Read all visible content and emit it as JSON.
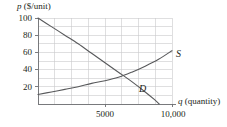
{
  "chart_data": {
    "type": "line",
    "title": "",
    "xlabel": "q (quantity)",
    "ylabel": "p ($/unit)",
    "xlim": [
      0,
      11000
    ],
    "ylim": [
      0,
      100
    ],
    "grid": true,
    "grid_x_step": 1250,
    "grid_y_step": 10,
    "legend": "inline-curve-labels",
    "xticks": [
      {
        "value": 5000,
        "label": "5000"
      },
      {
        "value": 10000,
        "label": "10,000"
      }
    ],
    "yticks": [
      {
        "value": 20,
        "label": "20"
      },
      {
        "value": 40,
        "label": "40"
      },
      {
        "value": 60,
        "label": "60"
      },
      {
        "value": 80,
        "label": "80"
      },
      {
        "value": 100,
        "label": "100"
      }
    ],
    "series": [
      {
        "name": "D",
        "label": "D",
        "description": "demand curve, downward sloping",
        "points": [
          [
            0,
            100
          ],
          [
            1000,
            90
          ],
          [
            2000,
            80
          ],
          [
            3000,
            70
          ],
          [
            4000,
            59
          ],
          [
            5000,
            48
          ],
          [
            6000,
            37
          ],
          [
            7000,
            26
          ],
          [
            8000,
            14
          ],
          [
            8700,
            5
          ],
          [
            9050,
            0
          ]
        ]
      },
      {
        "name": "S",
        "label": "S",
        "description": "supply curve, upward sloping",
        "points": [
          [
            0,
            11
          ],
          [
            1000,
            14
          ],
          [
            2000,
            17
          ],
          [
            3000,
            20
          ],
          [
            4000,
            24
          ],
          [
            5000,
            27
          ],
          [
            6000,
            31
          ],
          [
            7000,
            37
          ],
          [
            8000,
            44
          ],
          [
            9000,
            52
          ],
          [
            10000,
            62
          ]
        ]
      }
    ],
    "equilibrium": {
      "q": 6000,
      "p": 31
    },
    "annotations": [
      {
        "text": "S",
        "x": 10450,
        "y": 63
      },
      {
        "text": "D",
        "x": 8150,
        "y": 16
      }
    ]
  },
  "axes": {
    "y_axis_title_var": "p",
    "y_axis_title_unit": " ($/unit)",
    "x_axis_title_var": "q",
    "x_axis_title_unit": " (quantity)"
  },
  "colors": {
    "curve": "#58595b",
    "grid": "#c9cacc",
    "axis": "#6d6e71",
    "text": "#231f20",
    "background": "#ffffff"
  }
}
